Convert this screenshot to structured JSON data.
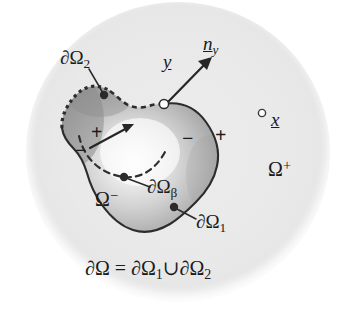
{
  "figure": {
    "name": "boundary-element-domain-diagram",
    "background_color": "#ffffff",
    "outer_region": {
      "name": "omega-plus-disc",
      "label": "Ω",
      "superscript": "+",
      "fill_color": "#e8e8e8",
      "center_x": 178,
      "center_y": 152,
      "radius_x": 152,
      "radius_y": 150
    },
    "inner_region": {
      "name": "omega-minus-blob",
      "label": "Ω",
      "superscript": "−",
      "fill_light": "#f2f2f2",
      "fill_mid": "#c6c6c6",
      "fill_dark": "#8e8e8e",
      "stroke_color": "#3a3a3a"
    },
    "stroke_color": "#262626",
    "marker_fill": "#ffffff",
    "dot_color": "#333333"
  },
  "labels": {
    "boundary_2": {
      "base": "∂Ω",
      "sub": "2"
    },
    "boundary_1": {
      "base": "∂Ω",
      "sub": "1"
    },
    "boundary_beta": {
      "base": "∂Ω",
      "sub": "β"
    },
    "point_y": "y",
    "normal_ny": {
      "base": "n",
      "sub": "y"
    },
    "point_x": "x",
    "omega_plus": {
      "base": "Ω",
      "sup": "+"
    },
    "omega_minus": {
      "base": "Ω",
      "sup": "−"
    },
    "sign_plus_inner": "+",
    "sign_minus_inner": "−",
    "sign_minus_middle": "−",
    "sign_plus_outer": "+",
    "caption": {
      "lhs": "∂Ω",
      "equals": "=",
      "term1_base": "∂Ω",
      "term1_sub": "1",
      "union": "∪",
      "term2_base": "∂Ω",
      "term2_sub": "2"
    }
  },
  "markers": {
    "y_open_circle": {
      "x": 164,
      "y": 104
    },
    "x_open_circle": {
      "x": 262,
      "y": 113
    },
    "dot_boundary_2": {
      "x": 104,
      "y": 96
    },
    "dot_boundary_1": {
      "x": 173,
      "y": 207
    },
    "dot_beta": {
      "x": 124,
      "y": 177
    }
  }
}
